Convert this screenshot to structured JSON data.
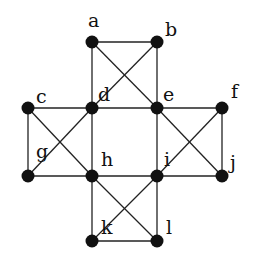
{
  "diagram": {
    "type": "graph",
    "node_color": "#111111",
    "edge_color": "#222222",
    "nodes": [
      {
        "id": "a",
        "label": "a",
        "x": 92,
        "y": 42,
        "lx": 88,
        "ly": 27
      },
      {
        "id": "b",
        "label": "b",
        "x": 157,
        "y": 42,
        "lx": 165,
        "ly": 36
      },
      {
        "id": "c",
        "label": "c",
        "x": 28,
        "y": 108,
        "lx": 36,
        "ly": 103
      },
      {
        "id": "d",
        "label": "d",
        "x": 92,
        "y": 108,
        "lx": 98,
        "ly": 101
      },
      {
        "id": "e",
        "label": "e",
        "x": 157,
        "y": 108,
        "lx": 163,
        "ly": 101
      },
      {
        "id": "f",
        "label": "f",
        "x": 222,
        "y": 108,
        "lx": 231,
        "ly": 98
      },
      {
        "id": "g",
        "label": "g",
        "x": 28,
        "y": 176,
        "lx": 36,
        "ly": 158
      },
      {
        "id": "h",
        "label": "h",
        "x": 92,
        "y": 176,
        "lx": 101,
        "ly": 166
      },
      {
        "id": "i",
        "label": "i",
        "x": 157,
        "y": 176,
        "lx": 164,
        "ly": 166
      },
      {
        "id": "j",
        "label": "j",
        "x": 222,
        "y": 176,
        "lx": 230,
        "ly": 169
      },
      {
        "id": "k",
        "label": "k",
        "x": 92,
        "y": 241,
        "lx": 101,
        "ly": 234
      },
      {
        "id": "l",
        "label": "l",
        "x": 157,
        "y": 241,
        "lx": 166,
        "ly": 234
      }
    ],
    "edges": [
      [
        "a",
        "b"
      ],
      [
        "a",
        "d"
      ],
      [
        "b",
        "e"
      ],
      [
        "a",
        "e"
      ],
      [
        "b",
        "d"
      ],
      [
        "c",
        "d"
      ],
      [
        "d",
        "e"
      ],
      [
        "e",
        "f"
      ],
      [
        "c",
        "g"
      ],
      [
        "c",
        "h"
      ],
      [
        "g",
        "d"
      ],
      [
        "d",
        "h"
      ],
      [
        "e",
        "i"
      ],
      [
        "e",
        "j"
      ],
      [
        "f",
        "i"
      ],
      [
        "f",
        "j"
      ],
      [
        "g",
        "h"
      ],
      [
        "h",
        "i"
      ],
      [
        "i",
        "j"
      ],
      [
        "h",
        "k"
      ],
      [
        "i",
        "l"
      ],
      [
        "h",
        "l"
      ],
      [
        "i",
        "k"
      ],
      [
        "k",
        "l"
      ]
    ]
  }
}
